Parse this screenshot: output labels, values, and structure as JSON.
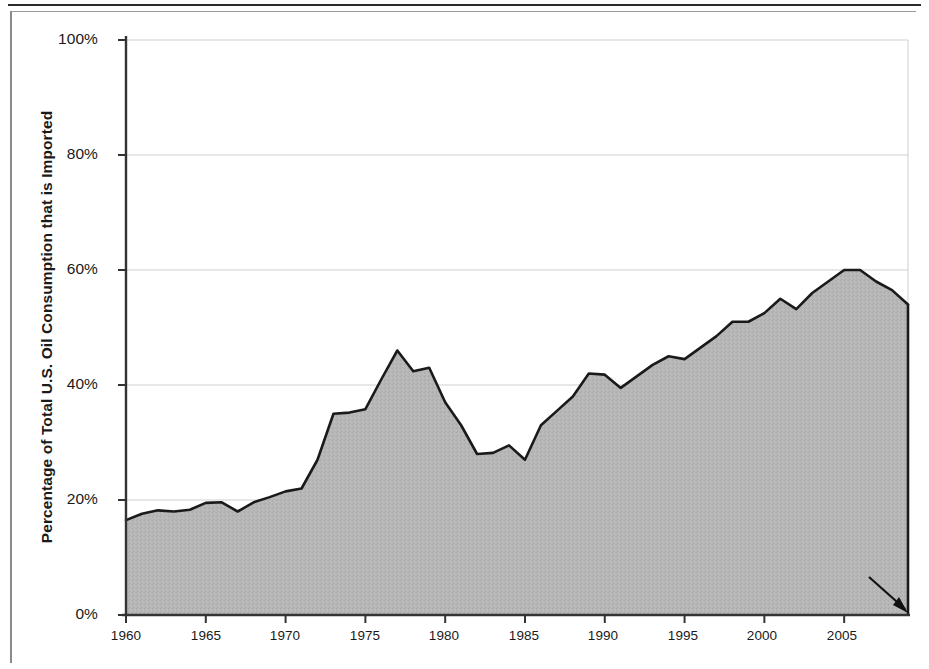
{
  "chart_data": {
    "type": "area",
    "title": "",
    "xlabel": "",
    "ylabel": "Percentage of Total U.S. Oil Consumption that is Imported",
    "xlim": [
      1960,
      2009
    ],
    "ylim": [
      0,
      100
    ],
    "grid": true,
    "legend_position": "none",
    "y_tick_labels": [
      "0%",
      "20%",
      "40%",
      "60%",
      "80%",
      "100%"
    ],
    "y_tick_values": [
      0,
      20,
      40,
      60,
      80,
      100
    ],
    "x_tick_labels": [
      "1960",
      "1965",
      "1970",
      "1975",
      "1980",
      "1985",
      "1990",
      "1995",
      "2000",
      "2005"
    ],
    "x_tick_values": [
      1960,
      1965,
      1970,
      1975,
      1980,
      1985,
      1990,
      1995,
      2000,
      2005
    ],
    "series": [
      {
        "name": "Percentage of U.S. oil consumption that is imported",
        "x": [
          1960,
          1961,
          1962,
          1963,
          1964,
          1965,
          1966,
          1967,
          1968,
          1969,
          1970,
          1971,
          1972,
          1973,
          1974,
          1975,
          1976,
          1977,
          1978,
          1979,
          1980,
          1981,
          1982,
          1983,
          1984,
          1985,
          1986,
          1987,
          1988,
          1989,
          1990,
          1991,
          1992,
          1993,
          1994,
          1995,
          1996,
          1997,
          1998,
          1999,
          2000,
          2001,
          2002,
          2003,
          2004,
          2005,
          2006,
          2007,
          2008,
          2009
        ],
        "values": [
          16.5,
          17.6,
          18.2,
          18.0,
          18.3,
          19.5,
          19.6,
          18.0,
          19.6,
          20.5,
          21.5,
          22.0,
          27.0,
          35.0,
          35.2,
          35.8,
          41.0,
          46.0,
          42.4,
          43.0,
          37.0,
          33.0,
          28.0,
          28.2,
          29.5,
          27.0,
          33.0,
          35.5,
          38.0,
          42.0,
          41.8,
          39.5,
          41.5,
          43.5,
          45.0,
          44.5,
          46.5,
          48.5,
          51.0,
          51.0,
          52.5,
          55.0,
          53.2,
          56.0,
          58.0,
          60.0,
          60.0,
          58.0,
          56.5,
          54.0
        ]
      }
    ],
    "annotations": [
      {
        "text": "2009 ytd",
        "x": 2009,
        "y": 0,
        "kind": "arrow-callout"
      }
    ],
    "style": {
      "area_fill": "#b4b4b4",
      "line_color": "#1a1a1a",
      "gridline_color": "#cfcfcf",
      "axis_color": "#333333",
      "background": "#ffffff"
    }
  },
  "axis": {
    "y_title": "Percentage of Total U.S. Oil Consumption that is Imported",
    "y_ticks": [
      {
        "label": "100%",
        "value": 100
      },
      {
        "label": "80%",
        "value": 80
      },
      {
        "label": "60%",
        "value": 60
      },
      {
        "label": "40%",
        "value": 40
      },
      {
        "label": "20%",
        "value": 20
      },
      {
        "label": "0%",
        "value": 0
      }
    ],
    "x_ticks": [
      {
        "label": "1960",
        "value": 1960
      },
      {
        "label": "1965",
        "value": 1965
      },
      {
        "label": "1970",
        "value": 1970
      },
      {
        "label": "1975",
        "value": 1975
      },
      {
        "label": "1980",
        "value": 1980
      },
      {
        "label": "1985",
        "value": 1985
      },
      {
        "label": "1990",
        "value": 1990
      },
      {
        "label": "1995",
        "value": 1995
      },
      {
        "label": "2000",
        "value": 2000
      },
      {
        "label": "2005",
        "value": 2005
      }
    ]
  },
  "annotation": {
    "ytd_label": "2009 ytd"
  }
}
